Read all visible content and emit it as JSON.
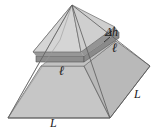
{
  "figure": {
    "name": "pyramid-slab-diagram",
    "background_color": "#ffffff",
    "labels": {
      "delta_h": "Δh",
      "ell_right": "ℓ",
      "ell_left": "ℓ",
      "L_right": "L",
      "L_bottom": "L"
    },
    "colors": {
      "face_front_left": "#c6c6c6",
      "face_front_right": "#d8d8d8",
      "face_upper_left": "#e8e8e8",
      "face_upper_right": "#d0d0d0",
      "slab_top": "#9a9a9a",
      "slab_side": "#8f8f8f",
      "cut_face": "#b5b5b5",
      "outline": "#4a4a4a",
      "gap": "#ffffff",
      "label_color": "#1a1a1a"
    },
    "geometry": {
      "apex": [
        72,
        5
      ],
      "base_left": [
        8,
        118
      ],
      "base_front": [
        110,
        118
      ],
      "base_right": [
        150,
        66
      ],
      "base_back": [
        60,
        40
      ],
      "slab_top_level_y": 38,
      "slab_bottom_level_y": 56,
      "gap_level_y": 60
    }
  }
}
